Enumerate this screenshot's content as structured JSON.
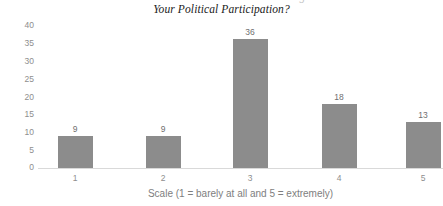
{
  "chart": {
    "title_line1": "How Much Have Social Media Changed",
    "title_line2": "Your Political Participation?",
    "xlabel": "Scale (1 = barely at all and 5 = extremely)",
    "ylabel": "",
    "bar_color": "#8c8c8c",
    "axis_color": "#d9d9d9",
    "tick_color": "#8e8e8e",
    "background": "#ffffff"
  },
  "chart_data": {
    "type": "bar",
    "title": "Your Political Participation?",
    "xlabel": "Scale (1 = barely at all and 5 = extremely)",
    "ylabel": "",
    "categories": [
      "1",
      "2",
      "3",
      "4",
      "5"
    ],
    "values": [
      9,
      9,
      36,
      18,
      13
    ],
    "value_labels": [
      "9",
      "9",
      "36",
      "18",
      "13"
    ],
    "ylim": [
      0,
      40
    ],
    "yticks": [
      0,
      5,
      10,
      15,
      20,
      25,
      30,
      35,
      40
    ],
    "ytick_labels": [
      "0",
      "5",
      "10",
      "15",
      "20",
      "25",
      "30",
      "35",
      "40"
    ],
    "grid": false,
    "legend": false,
    "legend_position": "none",
    "series": [
      {
        "name": "Responses",
        "values": [
          9,
          9,
          36,
          18,
          13
        ]
      }
    ]
  }
}
